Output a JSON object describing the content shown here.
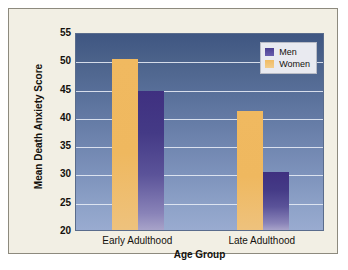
{
  "chart_data": {
    "type": "bar",
    "title": "",
    "xlabel": "Age Group",
    "ylabel": "Mean Death Anxiety Score",
    "categories": [
      "Early Adulthood",
      "Late Adulthood"
    ],
    "series": [
      {
        "name": "Women",
        "values": [
          50.2,
          41.0
        ],
        "color": "#efb85f"
      },
      {
        "name": "Men",
        "values": [
          44.5,
          30.3
        ],
        "color": "#4b3f92"
      }
    ],
    "ylim": [
      20,
      55
    ],
    "yticks": [
      20,
      25,
      30,
      35,
      40,
      45,
      50,
      55
    ],
    "ytick_labels": [
      "20",
      "25",
      "30",
      "35",
      "40",
      "45",
      "50",
      "55"
    ],
    "grid": true,
    "legend_position": "top-right",
    "legend_entries": [
      "Men",
      "Women"
    ],
    "plot_bg_top": "#3f5682",
    "plot_bg_bottom": "#99abd0",
    "figure_bg": "#f2efe4"
  }
}
